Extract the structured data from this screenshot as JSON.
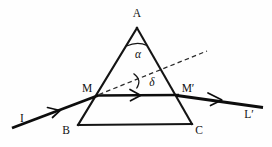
{
  "figure": {
    "background_color": "#fefefe",
    "ink_color": "#141414",
    "width": 272,
    "height": 147
  },
  "labels": {
    "apex": "A",
    "bottom_left": "B",
    "bottom_right": "C",
    "entry_point": "M",
    "exit_point": "M′",
    "incident_ray": "I",
    "emergent_ray": "L′",
    "apex_angle": "α",
    "deviation_angle": "δ"
  },
  "geometry": {
    "prism": {
      "apex": [
        137,
        28
      ],
      "bottom_left": [
        78,
        125
      ],
      "bottom_right": [
        192,
        124
      ]
    },
    "entry_point": [
      97,
      95
    ],
    "exit_point": [
      178,
      95
    ],
    "incident_ray_start": [
      12,
      128
    ],
    "emergent_ray_end": [
      263,
      107
    ],
    "dashed_extension_end": [
      207,
      51
    ],
    "apex_arc_radius": 17,
    "deviation_arc_radius": 20
  },
  "icons": {
    "incident_arrow": "arrow-right-icon",
    "internal_arrow": "arrow-right-icon",
    "emergent_arrow": "arrow-right-icon"
  }
}
